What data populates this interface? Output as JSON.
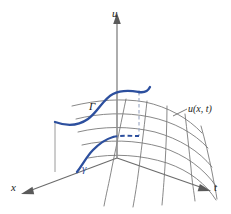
{
  "figure": {
    "kind": "math-diagram",
    "background_color": "#ffffff",
    "curve_color": "#2c4f9e",
    "mesh_color": "#737373",
    "axis_color": "#6b6b6b"
  },
  "axes": [
    {
      "id": "u",
      "label": "u",
      "direction": "up",
      "arrow": true
    },
    {
      "id": "x",
      "label": "x",
      "direction": "down-left",
      "arrow": true
    },
    {
      "id": "t",
      "label": "t",
      "direction": "down-right",
      "arrow": true
    }
  ],
  "labels": {
    "u_axis": "u",
    "x_axis": "x",
    "t_axis": "t",
    "surface": "u(x, t)",
    "lifted_curve": "Γ",
    "base_curve": "γ"
  },
  "annotations": [
    {
      "name": "surface-label",
      "text": "u(x, t)",
      "leader": true,
      "color": "#1a1a1a"
    },
    {
      "name": "lifted-curve-label",
      "text": "Γ",
      "leader": false,
      "color": "#1a1a1a"
    },
    {
      "name": "base-curve-label",
      "text": "γ",
      "leader": false,
      "color": "#2c4f9e"
    }
  ],
  "elements": {
    "surface_mesh": {
      "name": "solution-surface-mesh",
      "rows": 5,
      "cols": 5
    },
    "lifted_curve": {
      "name": "lifted-curve-gamma-upper",
      "style": "solid"
    },
    "base_curve": {
      "name": "base-curve-gamma-lower",
      "style": "solid"
    },
    "hidden_curve": {
      "name": "hidden-curve-segment",
      "style": "dashed"
    },
    "drop_lines": {
      "name": "projection-drop-lines",
      "count": 2
    }
  }
}
